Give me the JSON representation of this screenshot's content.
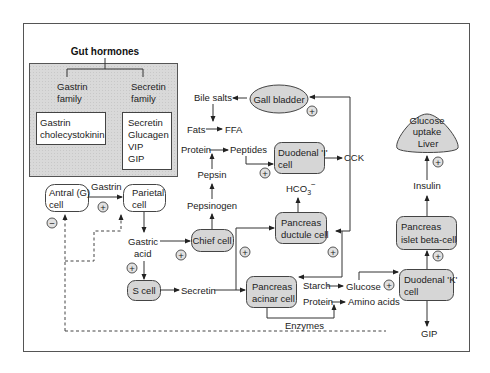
{
  "legend": {
    "title": "Gut hormones",
    "families": [
      {
        "name_line1": "Gastrin",
        "name_line2": "family",
        "members": [
          "Gastrin",
          "cholecystokinin"
        ]
      },
      {
        "name_line1": "Secretin",
        "name_line2": "family",
        "members": [
          "Secretin",
          "Glucagen",
          "VIP",
          "GIP"
        ]
      }
    ]
  },
  "nodes": {
    "antral_cell": [
      "Antral (G)",
      "cell"
    ],
    "parietal_cell": [
      "Parietal",
      "cell"
    ],
    "chief_cell": "Chief cell",
    "s_cell": "S cell",
    "gall_bladder": "Gall bladder",
    "duodenal_i_cell": [
      "Duodenal 'I'",
      "cell"
    ],
    "pancreas_ductule_cell": [
      "Pancreas",
      "ductule cell"
    ],
    "pancreas_acinar_cell": [
      "Pancreas",
      "acinar cell"
    ],
    "duodenal_k_cell": [
      "Duodenal 'K'",
      "cell"
    ],
    "pancreas_islet_cell": [
      "Pancreas",
      "islet beta-cell"
    ],
    "liver": [
      "Glucose",
      "uptake",
      "Liver"
    ]
  },
  "labels": {
    "gastrin": "Gastrin",
    "gastric_acid": [
      "Gastric",
      "acid"
    ],
    "secretin": "Secretin",
    "pepsinogen": "Pepsinogen",
    "pepsin": "Pepsin",
    "protein_top": "Protein",
    "peptides": "Peptides",
    "fats": "Fats",
    "ffa": "FFA",
    "bile_salts": "Bile salts",
    "cck": "CCK",
    "hco3": "HCO",
    "hco3_sub": "3",
    "hco3_sup": "−",
    "starch": "Starch",
    "glucose": "Glucose",
    "protein_bottom": "Protein",
    "amino_acids": "Amino acids",
    "enzymes": "Enzymes",
    "insulin": "Insulin",
    "gip": "GIP"
  },
  "signs": {
    "plus": "+",
    "minus": "−"
  },
  "colors": {
    "node_fill": "#d6d6d6",
    "legend_fill": "#d9d9d9",
    "stroke": "#333333"
  }
}
